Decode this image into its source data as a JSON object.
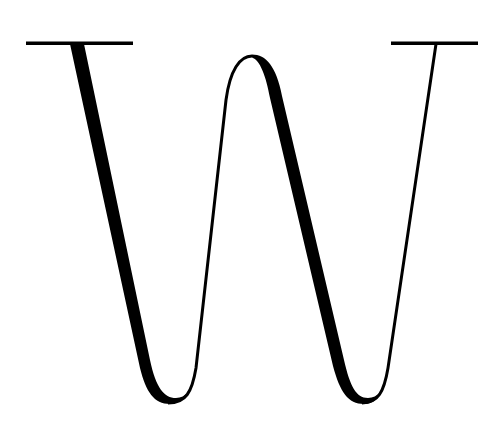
{
  "logo": {
    "letter": "W",
    "style": "high-contrast didone serif monogram",
    "icon": "w-monogram-icon",
    "colors": {
      "ink": "#000000",
      "background": "#ffffff"
    }
  }
}
